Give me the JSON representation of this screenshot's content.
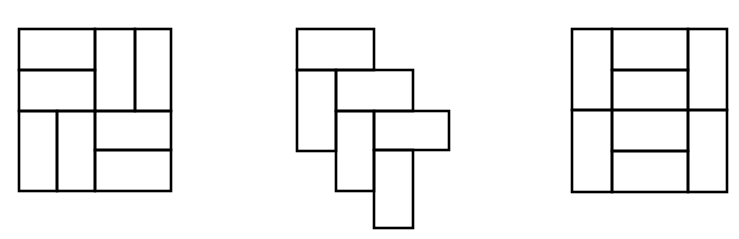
{
  "canvas": {
    "width": 739,
    "height": 239,
    "background": "#ffffff",
    "stroke_color": "#000000"
  },
  "figures": [
    {
      "id": "figure-1",
      "description": "Square tiled with 8 domino rectangles (pinwheel pattern)",
      "rects": [
        {
          "x": 19,
          "y": 29,
          "w": 76,
          "h": 41
        },
        {
          "x": 19,
          "y": 70,
          "w": 76,
          "h": 41
        },
        {
          "x": 95,
          "y": 29,
          "w": 40,
          "h": 82
        },
        {
          "x": 135,
          "y": 29,
          "w": 36,
          "h": 82
        },
        {
          "x": 19,
          "y": 111,
          "w": 38,
          "h": 80
        },
        {
          "x": 57,
          "y": 111,
          "w": 38,
          "h": 80
        },
        {
          "x": 95,
          "y": 111,
          "w": 76,
          "h": 39
        },
        {
          "x": 95,
          "y": 150,
          "w": 76,
          "h": 41
        }
      ]
    },
    {
      "id": "figure-2",
      "description": "Staircase arrangement of 6 domino rectangles",
      "rects": [
        {
          "x": 297,
          "y": 29,
          "w": 77,
          "h": 41
        },
        {
          "x": 297,
          "y": 70,
          "w": 39,
          "h": 81
        },
        {
          "x": 336,
          "y": 70,
          "w": 77,
          "h": 41
        },
        {
          "x": 336,
          "y": 111,
          "w": 38,
          "h": 80
        },
        {
          "x": 374,
          "y": 111,
          "w": 75,
          "h": 39
        },
        {
          "x": 374,
          "y": 150,
          "w": 39,
          "h": 78
        }
      ]
    },
    {
      "id": "figure-3",
      "description": "Square tiled with 8 domino rectangles (columns with stacked middle)",
      "rects": [
        {
          "x": 572,
          "y": 29,
          "w": 40,
          "h": 81
        },
        {
          "x": 572,
          "y": 110,
          "w": 40,
          "h": 82
        },
        {
          "x": 612,
          "y": 29,
          "w": 76,
          "h": 41
        },
        {
          "x": 612,
          "y": 70,
          "w": 76,
          "h": 40
        },
        {
          "x": 612,
          "y": 110,
          "w": 76,
          "h": 41
        },
        {
          "x": 612,
          "y": 151,
          "w": 76,
          "h": 41
        },
        {
          "x": 688,
          "y": 29,
          "w": 39,
          "h": 81
        },
        {
          "x": 688,
          "y": 110,
          "w": 39,
          "h": 82
        }
      ]
    }
  ]
}
